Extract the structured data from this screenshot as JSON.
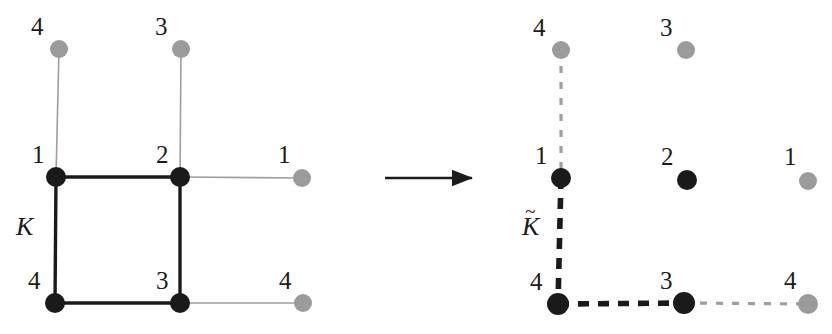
{
  "figure": {
    "width": 832,
    "height": 334,
    "background": "#ffffff",
    "colors": {
      "solid_vertex": "#1a1a1a",
      "ghost_vertex": "#9b9b9b",
      "solid_edge": "#1a1a1a",
      "ghost_edge": "#9e9e9e",
      "arrow": "#1c1c1c",
      "text": "#1c1c1c"
    }
  },
  "left_panel": {
    "complex_label": "K",
    "complex_label_tilde": "",
    "vertices": [
      {
        "id": "l-top-4",
        "label": "4",
        "kind": "ghost",
        "cx": 59,
        "cy": 49,
        "r": 9,
        "label_x": 31,
        "label_y": 14
      },
      {
        "id": "l-top-3",
        "label": "3",
        "kind": "ghost",
        "cx": 181,
        "cy": 49,
        "r": 9,
        "label_x": 155,
        "label_y": 14
      },
      {
        "id": "l-mid-1",
        "label": "1",
        "kind": "solid",
        "cx": 56,
        "cy": 177,
        "r": 10,
        "label_x": 32,
        "label_y": 142
      },
      {
        "id": "l-mid-2",
        "label": "2",
        "kind": "solid",
        "cx": 180,
        "cy": 177,
        "r": 10,
        "label_x": 156,
        "label_y": 142
      },
      {
        "id": "l-right-1",
        "label": "1",
        "kind": "ghost",
        "cx": 302,
        "cy": 178,
        "r": 9,
        "label_x": 278,
        "label_y": 142
      },
      {
        "id": "l-bot-4",
        "label": "4",
        "kind": "solid",
        "cx": 55,
        "cy": 303,
        "r": 10,
        "label_x": 28,
        "label_y": 268
      },
      {
        "id": "l-bot-3",
        "label": "3",
        "kind": "solid",
        "cx": 180,
        "cy": 303,
        "r": 10,
        "label_x": 156,
        "label_y": 268
      },
      {
        "id": "l-bot-4r",
        "label": "4",
        "kind": "ghost",
        "cx": 303,
        "cy": 303,
        "r": 9,
        "label_x": 279,
        "label_y": 268
      }
    ],
    "edges": [
      {
        "id": "l-e-top-left",
        "from": "l-top-4",
        "to": "l-mid-1",
        "kind": "ghost",
        "style": "solid"
      },
      {
        "id": "l-e-top-mid",
        "from": "l-top-3",
        "to": "l-mid-2",
        "kind": "ghost",
        "style": "solid"
      },
      {
        "id": "l-e-square-top",
        "from": "l-mid-1",
        "to": "l-mid-2",
        "kind": "solid",
        "style": "solid"
      },
      {
        "id": "l-e-right-mid",
        "from": "l-mid-2",
        "to": "l-right-1",
        "kind": "ghost",
        "style": "solid"
      },
      {
        "id": "l-e-square-left",
        "from": "l-mid-1",
        "to": "l-bot-4",
        "kind": "solid",
        "style": "solid"
      },
      {
        "id": "l-e-square-rgt",
        "from": "l-mid-2",
        "to": "l-bot-3",
        "kind": "solid",
        "style": "solid"
      },
      {
        "id": "l-e-square-bot",
        "from": "l-bot-4",
        "to": "l-bot-3",
        "kind": "solid",
        "style": "solid"
      },
      {
        "id": "l-e-bot-right",
        "from": "l-bot-3",
        "to": "l-bot-4r",
        "kind": "ghost",
        "style": "solid"
      }
    ],
    "complex_label_pos": {
      "x": 16,
      "y": 214
    }
  },
  "arrow": {
    "label": "maps-to-arrow",
    "x1": 385,
    "y1": 178,
    "x2": 472,
    "y2": 178
  },
  "right_panel": {
    "complex_label": "K",
    "complex_label_tilde": "~",
    "vertices": [
      {
        "id": "r-top-4",
        "label": "4",
        "kind": "ghost",
        "cx": 71,
        "cy": 50,
        "r": 9,
        "label_x": 43,
        "label_y": 15
      },
      {
        "id": "r-top-3",
        "label": "3",
        "kind": "ghost",
        "cx": 196,
        "cy": 50,
        "r": 9,
        "label_x": 170,
        "label_y": 15
      },
      {
        "id": "r-mid-1",
        "label": "1",
        "kind": "solid",
        "cx": 71,
        "cy": 178,
        "r": 10,
        "label_x": 45,
        "label_y": 143
      },
      {
        "id": "r-mid-2",
        "label": "2",
        "kind": "solid",
        "cx": 197,
        "cy": 180,
        "r": 10,
        "label_x": 171,
        "label_y": 144
      },
      {
        "id": "r-right-1",
        "label": "1",
        "kind": "ghost",
        "cx": 318,
        "cy": 181,
        "r": 9,
        "label_x": 294,
        "label_y": 144
      },
      {
        "id": "r-bot-4",
        "label": "4",
        "kind": "solid",
        "cx": 68,
        "cy": 304,
        "r": 11,
        "label_x": 40,
        "label_y": 269
      },
      {
        "id": "r-bot-3",
        "label": "3",
        "kind": "solid",
        "cx": 194,
        "cy": 303,
        "r": 11,
        "label_x": 170,
        "label_y": 268
      },
      {
        "id": "r-bot-4r",
        "label": "4",
        "kind": "ghost",
        "cx": 318,
        "cy": 304,
        "r": 10,
        "label_x": 294,
        "label_y": 268
      }
    ],
    "edges": [
      {
        "id": "r-e-top-left",
        "from": "r-top-4",
        "to": "r-mid-1",
        "kind": "ghost",
        "style": "dashed"
      },
      {
        "id": "r-e-left",
        "from": "r-mid-1",
        "to": "r-bot-4",
        "kind": "solid",
        "style": "dashed"
      },
      {
        "id": "r-e-bottom",
        "from": "r-bot-4",
        "to": "r-bot-3",
        "kind": "solid",
        "style": "dashed"
      },
      {
        "id": "r-e-bot-right",
        "from": "r-bot-3",
        "to": "r-bot-4r",
        "kind": "ghost",
        "style": "dashed"
      }
    ],
    "complex_label_pos": {
      "x": 32,
      "y": 214
    }
  }
}
